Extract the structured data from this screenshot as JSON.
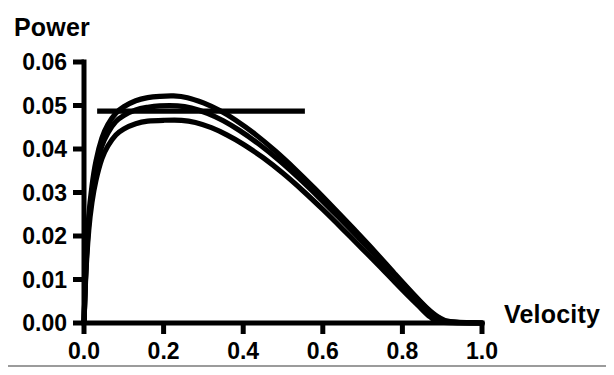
{
  "figure": {
    "background_color": "#ffffff",
    "ink_color": "#000000",
    "rule_color": "#9b9b9b"
  },
  "chart_data": {
    "type": "line",
    "title": "",
    "xlabel": "Velocity",
    "ylabel": "Power",
    "xlim": [
      0.0,
      1.0
    ],
    "ylim": [
      0.0,
      0.06
    ],
    "grid": false,
    "legend": null,
    "xticks": [
      "0.0",
      "0.2",
      "0.4",
      "0.6",
      "0.8",
      "1.0"
    ],
    "xtick_values": [
      0.0,
      0.2,
      0.4,
      0.6,
      0.8,
      1.0
    ],
    "yticks": [
      "0.00",
      "0.01",
      "0.02",
      "0.03",
      "0.04",
      "0.05",
      "0.06"
    ],
    "ytick_values": [
      0.0,
      0.01,
      0.02,
      0.03,
      0.04,
      0.05,
      0.06
    ],
    "annotations": [
      {
        "name": "reference-line",
        "type": "horizontal-line",
        "y": 0.0487,
        "x_start": 0.033,
        "x_end": 0.555
      }
    ],
    "series": [
      {
        "name": "curve-upper",
        "peak_x": 0.225,
        "peak_y": 0.0522,
        "zero_crossing_x": 0.9,
        "x": [
          0.0,
          0.005,
          0.012,
          0.02,
          0.03,
          0.045,
          0.06,
          0.08,
          0.1,
          0.13,
          0.16,
          0.19,
          0.225,
          0.26,
          0.3,
          0.34,
          0.38,
          0.43,
          0.48,
          0.53,
          0.58,
          0.63,
          0.68,
          0.73,
          0.78,
          0.82,
          0.86,
          0.89,
          0.92,
          1.0
        ],
        "y": [
          0.0,
          0.0135,
          0.0245,
          0.0315,
          0.0372,
          0.0425,
          0.0456,
          0.0482,
          0.0497,
          0.0511,
          0.0518,
          0.0521,
          0.0522,
          0.0518,
          0.0506,
          0.0489,
          0.0467,
          0.0434,
          0.0396,
          0.0354,
          0.0309,
          0.0262,
          0.0214,
          0.0165,
          0.0114,
          0.0074,
          0.0036,
          0.0014,
          0.0003,
          0.0
        ]
      },
      {
        "name": "curve-middle",
        "peak_x": 0.235,
        "peak_y": 0.0499,
        "zero_crossing_x": 0.885,
        "x": [
          0.0,
          0.005,
          0.012,
          0.02,
          0.03,
          0.045,
          0.06,
          0.08,
          0.1,
          0.13,
          0.16,
          0.19,
          0.235,
          0.27,
          0.31,
          0.35,
          0.39,
          0.44,
          0.49,
          0.54,
          0.59,
          0.64,
          0.69,
          0.74,
          0.78,
          0.82,
          0.85,
          0.88,
          0.91,
          1.0
        ],
        "y": [
          0.0,
          0.0128,
          0.0232,
          0.03,
          0.0355,
          0.0407,
          0.0437,
          0.0463,
          0.0477,
          0.049,
          0.0496,
          0.0499,
          0.0499,
          0.0494,
          0.0482,
          0.0465,
          0.0443,
          0.0411,
          0.0374,
          0.0333,
          0.0289,
          0.0243,
          0.0196,
          0.0148,
          0.011,
          0.0072,
          0.0043,
          0.0018,
          0.0003,
          0.0
        ]
      },
      {
        "name": "curve-lower",
        "peak_x": 0.245,
        "peak_y": 0.0466,
        "zero_crossing_x": 0.87,
        "x": [
          0.0,
          0.005,
          0.012,
          0.02,
          0.03,
          0.045,
          0.06,
          0.08,
          0.1,
          0.13,
          0.16,
          0.2,
          0.245,
          0.28,
          0.32,
          0.36,
          0.4,
          0.45,
          0.5,
          0.55,
          0.6,
          0.65,
          0.7,
          0.74,
          0.78,
          0.81,
          0.84,
          0.87,
          0.9,
          1.0
        ],
        "y": [
          0.0,
          0.0118,
          0.0214,
          0.0277,
          0.0328,
          0.0378,
          0.0407,
          0.0432,
          0.0446,
          0.0458,
          0.0464,
          0.0466,
          0.0466,
          0.0461,
          0.0449,
          0.0432,
          0.0411,
          0.038,
          0.0344,
          0.0304,
          0.0261,
          0.0216,
          0.017,
          0.0133,
          0.0095,
          0.0067,
          0.004,
          0.0014,
          0.0002,
          0.0
        ]
      }
    ]
  },
  "axes": {
    "y_title": "Power",
    "x_title": "Velocity",
    "y_tick_labels": [
      "0.06",
      "0.05",
      "0.04",
      "0.03",
      "0.02",
      "0.01",
      "0.00"
    ],
    "x_tick_labels": [
      "0.0",
      "0.2",
      "0.4",
      "0.6",
      "0.8",
      "1.0"
    ]
  }
}
